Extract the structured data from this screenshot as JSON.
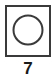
{
  "figure": {
    "label": "7",
    "colors": {
      "background": "#ffffff",
      "stroke": "#3a3a3a",
      "caption": "#1a1a1a",
      "fill": "#ffffff"
    },
    "shapes": {
      "square": {
        "name": "outer-square",
        "x": 6,
        "y": 6,
        "width": 44,
        "height": 50,
        "stroke_width": 2,
        "fill": "none"
      },
      "circle": {
        "name": "inner-circle",
        "cx": 28,
        "cy": 30,
        "r": 14.5,
        "stroke_width": 2,
        "fill": "none"
      }
    }
  }
}
